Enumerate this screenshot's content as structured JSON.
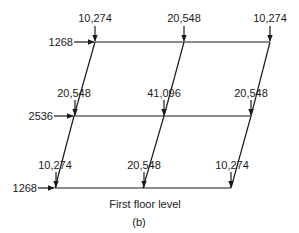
{
  "diagram": {
    "floors": [
      {
        "name": "top",
        "lateral_load": "1268",
        "vertical_loads": [
          "10,274",
          "20,548",
          "10,274"
        ]
      },
      {
        "name": "middle",
        "lateral_load": "2536",
        "vertical_loads": [
          "20,548",
          "41,096",
          "20,548"
        ]
      },
      {
        "name": "bottom",
        "lateral_load": "1268",
        "vertical_loads": [
          "10,274",
          "20,548",
          "10,274"
        ]
      }
    ],
    "caption": "First floor level",
    "sublabel": "(b)",
    "line_color": "#1a1a1a"
  }
}
